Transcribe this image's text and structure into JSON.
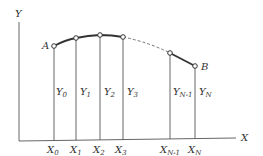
{
  "diagram": {
    "axes": {
      "y_label": "Y",
      "x_label": "X"
    },
    "endpoints": {
      "start": "A",
      "end": "B"
    },
    "ordinates": [
      {
        "y": "Y",
        "y_sub": "0",
        "x": "X",
        "x_sub": "0"
      },
      {
        "y": "Y",
        "y_sub": "1",
        "x": "X",
        "x_sub": "1"
      },
      {
        "y": "Y",
        "y_sub": "2",
        "x": "X",
        "x_sub": "2"
      },
      {
        "y": "Y",
        "y_sub": "3",
        "x": "X",
        "x_sub": "3"
      },
      {
        "y": "Y",
        "y_sub": "N-1",
        "x": "X",
        "x_sub": "N-1"
      },
      {
        "y": "Y",
        "y_sub": "N",
        "x": "X",
        "x_sub": "N"
      }
    ],
    "curve_segments": [
      {
        "from": 0,
        "to": 3,
        "style": "solid"
      },
      {
        "from": 3,
        "to": 4,
        "style": "dashed"
      },
      {
        "from": 4,
        "to": 5,
        "style": "solid"
      }
    ]
  }
}
